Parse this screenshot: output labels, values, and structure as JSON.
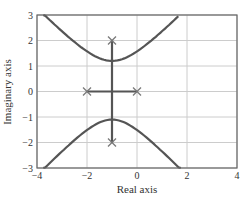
{
  "chart_data": {
    "type": "line",
    "title": "",
    "xlabel": "Real axis",
    "ylabel": "Imaginary axis",
    "xlim": [
      -4,
      4
    ],
    "ylim": [
      -3,
      3
    ],
    "xticks": [
      -4,
      -2,
      0,
      2,
      4
    ],
    "yticks": [
      -3,
      -2,
      -1,
      0,
      1,
      2,
      3
    ],
    "xtick_labels": [
      "−4",
      "−2",
      "0",
      "2",
      "4"
    ],
    "ytick_labels": [
      "−3",
      "−2",
      "−1",
      "0",
      "1",
      "2",
      "3"
    ],
    "grid": true,
    "legend": null,
    "poles": [
      {
        "x": -1,
        "y": 2
      },
      {
        "x": -1,
        "y": -2
      },
      {
        "x": -2,
        "y": 0
      },
      {
        "x": 0,
        "y": 0
      }
    ],
    "series": [
      {
        "name": "real-axis-segment",
        "x": [
          -2,
          0
        ],
        "y": [
          0,
          0
        ]
      },
      {
        "name": "vertical-segment",
        "x": [
          -1,
          -1
        ],
        "y": [
          2,
          -2
        ]
      },
      {
        "name": "upper-branch",
        "center_x": -1,
        "vertex_y": 1.2,
        "b": 1.18,
        "x": [
          -3.75,
          -3,
          -2,
          -1,
          0,
          1,
          1.65
        ],
        "y": [
          3.0,
          2.37,
          1.66,
          1.2,
          1.66,
          2.37,
          3.0
        ]
      },
      {
        "name": "lower-branch",
        "center_x": -1,
        "vertex_y": -1.1,
        "b": 1.06,
        "x": [
          -3.75,
          -3,
          -2,
          -1,
          0,
          1,
          1.75
        ],
        "y": [
          -3.0,
          -2.35,
          -1.6,
          -1.1,
          -1.6,
          -2.35,
          -3.0
        ]
      }
    ],
    "colors": {
      "line": "#555555",
      "grid": "#cccccc",
      "frame": "#666666",
      "marker": "#777777"
    }
  }
}
